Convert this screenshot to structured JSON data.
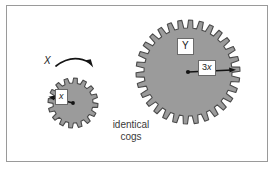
{
  "figure": {
    "background_color": "#ffffff",
    "frame_color": "#9a9a9a",
    "gear_fill": "#9b9b9b",
    "gear_stroke": "#4a4a4a",
    "ink_color": "#1a1a1a"
  },
  "labels": {
    "small_gear_name": "X",
    "small_gear_radius": "x",
    "large_gear_name": "Y",
    "large_gear_radius_number": "3",
    "large_gear_radius_variable": "x",
    "caption_line_1": "identical",
    "caption_line_2": "cogs"
  },
  "gears": {
    "small": {
      "name": "X",
      "center_x": 73,
      "center_y": 103,
      "outer_radius": 25,
      "root_radius": 20,
      "teeth": 16,
      "radius_label": "x"
    },
    "large": {
      "name": "Y",
      "center_x": 188,
      "center_y": 72,
      "outer_radius": 52,
      "root_radius": 44,
      "teeth": 30,
      "radius_label": "3x"
    }
  },
  "rotation_arrow": {
    "label": "X",
    "direction": "clockwise",
    "description": "curved arrow above small gear pointing right"
  }
}
